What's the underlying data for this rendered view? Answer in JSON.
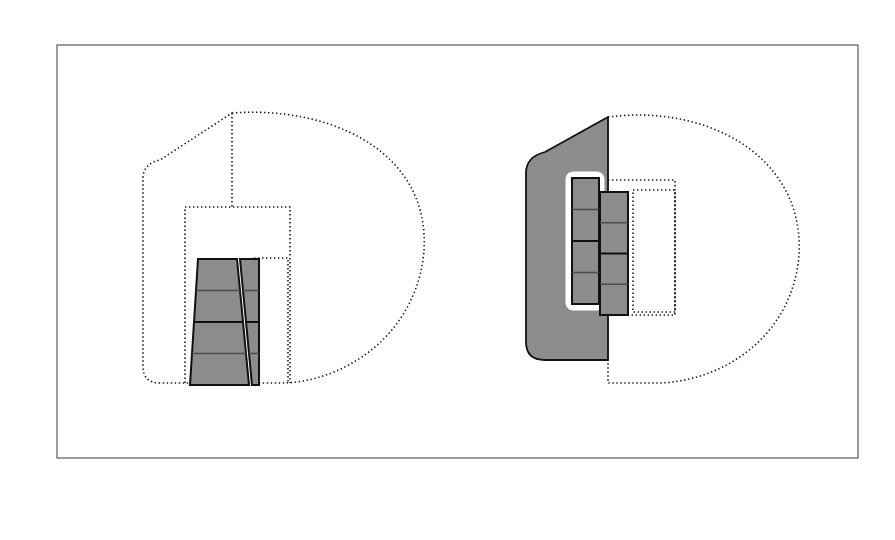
{
  "figure": {
    "kind": "patent-style-diagram",
    "canvas": {
      "width": 895,
      "height": 540,
      "background": "#ffffff"
    },
    "frame": {
      "x": 57,
      "y": 45,
      "width": 801,
      "height": 413,
      "stroke": "#4a4a4a"
    },
    "colors": {
      "gray_fill": "#8c8c8c",
      "outline_stroke": "#111111",
      "dotted_stroke": "#1a1a1a",
      "frame_stroke": "#4a4a4a",
      "white": "#ffffff"
    },
    "views": [
      {
        "id": "left-view",
        "name": "front-elevation-view",
        "description": "Dotted rounded body outline with stepped notch, inner dotted rectangles, and a pair of tapered four-segment gray strips",
        "outline_path": "M 232 113 C 300 108 370 128 404 176 C 432 215 430 270 404 313 C 378 356 330 381 285 383 L 160 383 C 148 383 143 377 143 366 L 143 178 C 143 168 150 162 160 160 L 232 113 Z",
        "notch_path": "M 232 113 L 232 207",
        "outer_rect": {
          "x": 185,
          "y": 207,
          "width": 105,
          "height": 176
        },
        "inner_rect": {
          "x": 255,
          "y": 258,
          "width": 33,
          "height": 125
        },
        "strips": [
          {
            "id": "left-leg",
            "segments": 4,
            "quad": "198,259 237,259 249,385 190,385"
          },
          {
            "id": "right-leg",
            "segments": 4,
            "quad": "240,259 259,259 259,385 252,385"
          }
        ]
      },
      {
        "id": "right-view",
        "name": "side-perspective-view",
        "description": "Dotted rounded body outline facing right, dark gray trapezoid flap panel, white sleeve and two offset four-segment gray strips",
        "outline_path": "M 608 117 C 676 108 745 130 778 178 C 806 217 806 272 780 315 C 754 358 706 381 661 383 L 608 383 L 608 117 Z",
        "trapezoid_path": "M 608 117 L 608 360 L 545 360 C 532 360 526 353 526 342 L 526 173 C 526 162 533 155 545 152 L 608 117 Z",
        "inner_rect": {
          "x": 633,
          "y": 190,
          "width": 42,
          "height": 122
        },
        "notch_rect": {
          "x": 608,
          "y": 180,
          "width": 67,
          "height": 135
        },
        "white_sleeve": {
          "x": 566,
          "y": 172,
          "width": 38,
          "height": 138,
          "radius": 7
        },
        "strips": [
          {
            "id": "inner-strip",
            "segments": 4,
            "rect": {
              "x": 572,
              "y": 178,
              "width": 27,
              "height": 126
            }
          },
          {
            "id": "outer-strip",
            "segments": 4,
            "rect": {
              "x": 600,
              "y": 192,
              "width": 28,
              "height": 123
            }
          }
        ]
      }
    ]
  }
}
